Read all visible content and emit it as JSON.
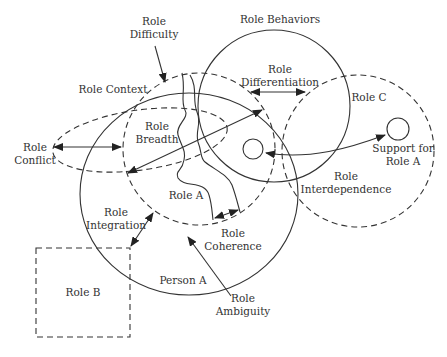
{
  "diagram": {
    "type": "role-theory-concept-diagram",
    "colors": {
      "stroke": "#333333",
      "text": "#333333",
      "background": "#ffffff"
    },
    "labels": {
      "role_difficulty": [
        "Role",
        "Difficulty"
      ],
      "role_behaviors": "Role Behaviors",
      "role_differentiation": [
        "Role",
        "Differentiation"
      ],
      "role_context": "Role Context",
      "role_c": "Role C",
      "role_breadth": [
        "Role",
        "Breadth"
      ],
      "role_conflict": [
        "Role",
        "Conflict"
      ],
      "support_for_role_a": [
        "Support for",
        "Role A"
      ],
      "role_interdependence": [
        "Role",
        "Interdependence"
      ],
      "role_a": "Role A",
      "role_integration": [
        "Role",
        "Integration"
      ],
      "role_coherence": [
        "Role",
        "Coherence"
      ],
      "role_b": "Role B",
      "person_a": "Person A",
      "role_ambiguity": [
        "Role",
        "Ambiguity"
      ]
    },
    "nodes": [
      {
        "id": "person-a",
        "shape": "circle",
        "style": "solid"
      },
      {
        "id": "role-context",
        "shape": "circle",
        "style": "dashed"
      },
      {
        "id": "role-behaviors",
        "shape": "circle",
        "style": "solid"
      },
      {
        "id": "role-c",
        "shape": "circle",
        "style": "dashed"
      },
      {
        "id": "role-conflict",
        "shape": "ellipse",
        "style": "dashed"
      },
      {
        "id": "role-b",
        "shape": "rectangle",
        "style": "dashed"
      },
      {
        "id": "support-for-role-a",
        "shape": "small-circle",
        "style": "solid"
      },
      {
        "id": "role-a-inner",
        "shape": "small-circle",
        "style": "solid"
      }
    ],
    "edges": [
      {
        "label": "Role Conflict",
        "type": "double-arrow"
      },
      {
        "label": "Role Breadth",
        "type": "double-arrow"
      },
      {
        "label": "Role Differentiation",
        "type": "double-arrow"
      },
      {
        "label": "Role Interdependence",
        "type": "double-arrow"
      },
      {
        "label": "Role Integration",
        "type": "double-arrow"
      },
      {
        "label": "Role Coherence",
        "type": "double-arrow"
      },
      {
        "label": "Role Difficulty",
        "type": "arrow"
      },
      {
        "label": "Role Ambiguity",
        "type": "arrow"
      }
    ]
  }
}
